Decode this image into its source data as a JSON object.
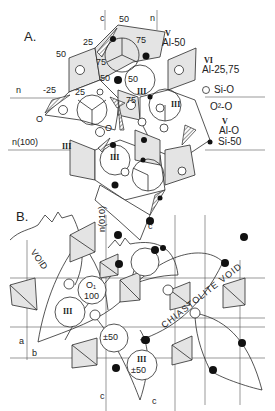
{
  "panel_a": {
    "label": "A.",
    "axes": {
      "c": "c",
      "n": "n",
      "n100": "n(100)"
    },
    "site_numbers": [
      "50",
      "25",
      "50",
      "75",
      "50",
      "75",
      "-25",
      "25",
      "50",
      "O",
      "O",
      "75"
    ],
    "roman": {
      "iii_a": "III",
      "iii_b": "III",
      "iii_c": "III",
      "iii_d": "III"
    },
    "legend": [
      {
        "sup": "V",
        "text": "Al-50",
        "symbol": "none"
      },
      {
        "sup": "VI",
        "text": "Al-25,75",
        "symbol": "none"
      },
      {
        "sup": "",
        "text": "Si-O",
        "symbol": "open-circle"
      },
      {
        "sup": "",
        "text": "O²-O",
        "symbol": "none"
      },
      {
        "sup": "V",
        "text": "Al-O",
        "symbol": "none"
      },
      {
        "sup": "",
        "text": "Si-50",
        "symbol": "filled-circle"
      }
    ]
  },
  "panel_b": {
    "label": "B.",
    "axes": {
      "n010": "n(010)",
      "c1": "c",
      "c2": "c",
      "c3": "c",
      "a": "a",
      "b": "b"
    },
    "void_left": "VOID",
    "void_right": "CHIASTOLITE VOID",
    "o1_label": "O₁",
    "o1_value": "100",
    "iii": "III",
    "pm50": "±50",
    "iii_pm50_roman": "III",
    "iii_pm50_value": "±50"
  }
}
